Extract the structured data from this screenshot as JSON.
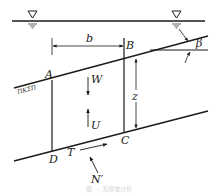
{
  "figure": {
    "type": "infinite-slope slice free-body diagram",
    "water_table_symbol": "water-level-triangle",
    "labels": {
      "A": "A",
      "B": "B",
      "C": "C",
      "D": "D",
      "b": "b",
      "z": "z",
      "beta": "β",
      "W": "W",
      "U": "U",
      "T": "T",
      "N": "N′",
      "ground_hatch": "ΠΚΣΠ"
    },
    "forces": [
      {
        "name": "W",
        "direction": "down"
      },
      {
        "name": "U",
        "direction": "up"
      },
      {
        "name": "T",
        "direction": "along slip surface, upslope"
      },
      {
        "name": "N′",
        "direction": "normal to slip surface"
      }
    ],
    "dimensions": [
      {
        "name": "b",
        "meaning": "slice width"
      },
      {
        "name": "z",
        "meaning": "vertical depth to slip surface"
      },
      {
        "name": "β",
        "meaning": "slope angle"
      }
    ],
    "caption": "图 … 无限坡分析"
  }
}
